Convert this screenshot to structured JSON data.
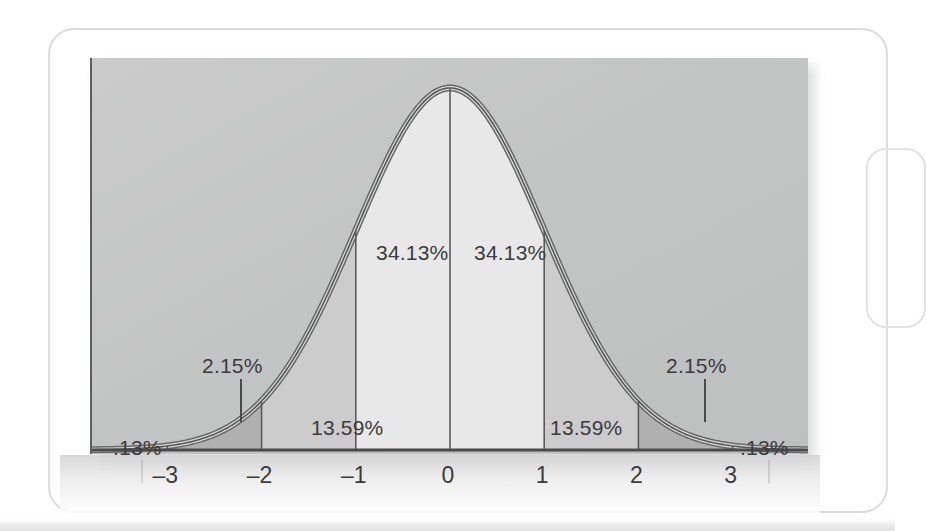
{
  "figure": {
    "background_color": "#ffffff",
    "plot_background_color": "#c5c5c5",
    "curve_color": "#5a5a5a",
    "inner_band_fill": "#e8e8e8",
    "mid_band_fill": "#cccccc",
    "tail_band_fill": "#b0b0b0"
  },
  "chart_data": {
    "type": "area",
    "title": "",
    "xlabel": "",
    "ylabel": "",
    "xlim": [
      -3.8,
      3.8
    ],
    "ylim": [
      0,
      0.42
    ],
    "grid": false,
    "legend": "none",
    "distribution": "standard normal",
    "x_ticks": [
      "-3",
      "-2",
      "-1",
      "0",
      "1",
      "2",
      "3"
    ],
    "x_tick_values": [
      -3,
      -2,
      -1,
      0,
      1,
      2,
      3
    ],
    "bands": [
      {
        "id": "band-neg3-neg2",
        "from": -3,
        "to": -2,
        "label": "2.15%",
        "value": 2.15,
        "fill": "tail"
      },
      {
        "id": "band-neg2-neg1",
        "from": -2,
        "to": -1,
        "label": "13.59%",
        "value": 13.59,
        "fill": "mid"
      },
      {
        "id": "band-neg1-0",
        "from": -1,
        "to": 0,
        "label": "34.13%",
        "value": 34.13,
        "fill": "inner"
      },
      {
        "id": "band-0-1",
        "from": 0,
        "to": 1,
        "label": "34.13%",
        "value": 34.13,
        "fill": "inner"
      },
      {
        "id": "band-1-2",
        "from": 1,
        "to": 2,
        "label": "13.59%",
        "value": 13.59,
        "fill": "mid"
      },
      {
        "id": "band-2-3",
        "from": 2,
        "to": 3,
        "label": "2.15%",
        "value": 2.15,
        "fill": "tail"
      }
    ],
    "tails": [
      {
        "id": "tail-left",
        "beyond": -3,
        "label": ".13%",
        "value": 0.13
      },
      {
        "id": "tail-right",
        "beyond": 3,
        "label": ".13%",
        "value": 0.13
      }
    ],
    "annotations": [
      {
        "id": "ann-left-013",
        "text": ".13%",
        "x": -3.45,
        "leader": true
      },
      {
        "id": "ann-left-215",
        "text": "2.15%",
        "x": -2.55,
        "leader": true
      },
      {
        "id": "ann-left-1359",
        "text": "13.59%",
        "x": -1.5,
        "leader": false
      },
      {
        "id": "ann-left-3413",
        "text": "34.13%",
        "x": -0.5,
        "leader": false
      },
      {
        "id": "ann-right-3413",
        "text": "34.13%",
        "x": 0.5,
        "leader": false
      },
      {
        "id": "ann-right-1359",
        "text": "13.59%",
        "x": 1.5,
        "leader": false
      },
      {
        "id": "ann-right-215",
        "text": "2.15%",
        "x": 2.55,
        "leader": true
      },
      {
        "id": "ann-right-013",
        "text": ".13%",
        "x": 3.45,
        "leader": true
      }
    ]
  },
  "labels": {
    "pct_left_013": ".13%",
    "pct_left_215": "2.15%",
    "pct_left_1359": "13.59%",
    "pct_left_3413": "34.13%",
    "pct_right_3413": "34.13%",
    "pct_right_1359": "13.59%",
    "pct_right_215": "2.15%",
    "pct_right_013": ".13%"
  },
  "axis": {
    "ticks": [
      {
        "label": "-3"
      },
      {
        "label": "-2"
      },
      {
        "label": "-1"
      },
      {
        "label": "0"
      },
      {
        "label": "1"
      },
      {
        "label": "2"
      },
      {
        "label": "3"
      }
    ]
  }
}
